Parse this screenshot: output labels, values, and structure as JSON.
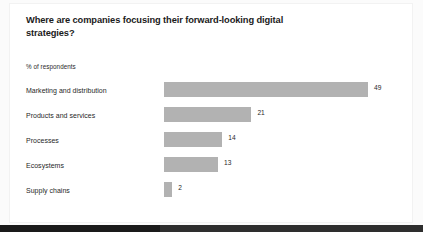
{
  "card": {
    "title": "Where are companies focusing their forward-looking digital strategies?",
    "subtitle": "% of respondents"
  },
  "chart_data": {
    "type": "bar",
    "orientation": "horizontal",
    "title": "Where are companies focusing their forward-looking digital strategies?",
    "subtitle": "% of respondents",
    "xlabel": "",
    "ylabel": "",
    "xlim": [
      0,
      49
    ],
    "grid": false,
    "legend": false,
    "unit": "%",
    "bar_color": "#b2b2b2",
    "categories": [
      "Marketing and distribution",
      "Products and services",
      "Processes",
      "Ecosystems",
      "Supply chains"
    ],
    "values": [
      49,
      21,
      14,
      13,
      2
    ],
    "value_labels": [
      "49",
      "21",
      "14",
      "13",
      "2"
    ]
  },
  "footer": {
    "band_color": "#2e2e2e",
    "accent_color": "#1a1a1a"
  }
}
